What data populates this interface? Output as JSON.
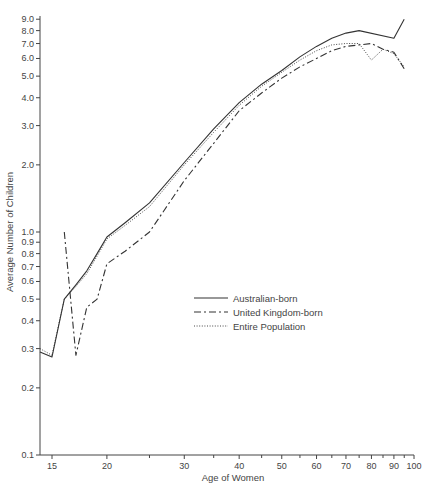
{
  "chart_data": {
    "type": "line",
    "title": "",
    "xlabel": "Age of Women",
    "ylabel": "Average Number of Children",
    "x_scale": "log",
    "y_scale": "log",
    "xlim": [
      14,
      100
    ],
    "ylim": [
      0.1,
      9.0
    ],
    "grid": false,
    "legend_position": "center-right",
    "x_ticks": [
      15,
      20,
      30,
      40,
      50,
      60,
      70,
      80,
      90,
      100
    ],
    "x_tick_labels": [
      "15",
      "20",
      "30",
      "40",
      "50",
      "60",
      "70",
      "80",
      "90",
      "100"
    ],
    "x_minor_ticks": [
      25,
      35,
      45,
      55,
      65,
      75,
      85,
      95
    ],
    "y_ticks": [
      0.1,
      0.2,
      0.3,
      0.4,
      0.5,
      0.6,
      0.7,
      0.8,
      0.9,
      1.0,
      2.0,
      3.0,
      4.0,
      5.0,
      6.0,
      7.0,
      8.0,
      9.0
    ],
    "y_tick_labels": [
      "0.1",
      "0.2",
      "0.3",
      "0.4",
      "0.5",
      "0.6",
      "0.7",
      "0.8",
      "0.9",
      "1.0",
      "2.0",
      "3.0",
      "4.0",
      "5.0",
      "6.0",
      "7.0",
      "8.0",
      "9.0"
    ],
    "series": [
      {
        "name": "Australian-born",
        "style": "solid",
        "x": [
          14,
          15,
          16,
          17,
          18,
          19,
          20,
          22,
          25,
          30,
          35,
          40,
          45,
          50,
          55,
          60,
          65,
          70,
          75,
          90,
          95
        ],
        "values": [
          0.29,
          0.275,
          0.5,
          0.58,
          0.67,
          0.8,
          0.95,
          1.1,
          1.35,
          2.05,
          2.9,
          3.8,
          4.6,
          5.3,
          6.1,
          6.8,
          7.4,
          7.8,
          8.0,
          7.4,
          9.0
        ]
      },
      {
        "name": "United Kingdom-born",
        "style": "dash-dot",
        "x": [
          16,
          17,
          18,
          19,
          20,
          22,
          25,
          30,
          35,
          40,
          45,
          50,
          55,
          60,
          65,
          70,
          75,
          80,
          85,
          90,
          95
        ],
        "values": [
          1.0,
          0.28,
          0.46,
          0.5,
          0.72,
          0.82,
          1.0,
          1.7,
          2.5,
          3.5,
          4.2,
          4.9,
          5.5,
          6.0,
          6.5,
          6.8,
          6.9,
          7.0,
          6.6,
          6.4,
          5.4
        ]
      },
      {
        "name": "Entire Population",
        "style": "dotted",
        "x": [
          14,
          15,
          16,
          17,
          18,
          19,
          20,
          22,
          25,
          30,
          35,
          40,
          45,
          50,
          55,
          60,
          65,
          70,
          75,
          80,
          85,
          90,
          95
        ],
        "values": [
          0.3,
          0.28,
          0.5,
          0.57,
          0.65,
          0.78,
          0.93,
          1.07,
          1.3,
          2.0,
          2.8,
          3.7,
          4.5,
          5.2,
          5.9,
          6.5,
          6.9,
          7.0,
          7.0,
          5.9,
          6.6,
          6.3,
          5.5
        ]
      }
    ]
  },
  "legend": {
    "items": [
      {
        "label": "Australian-born",
        "style": "solid"
      },
      {
        "label": "United Kingdom-born",
        "style": "dash-dot"
      },
      {
        "label": "Entire Population",
        "style": "dotted"
      }
    ]
  },
  "colors": {
    "line": "#333333",
    "axis": "#444444",
    "background": "#ffffff"
  }
}
